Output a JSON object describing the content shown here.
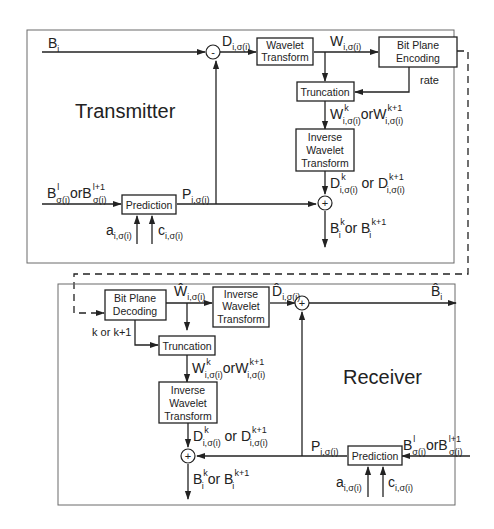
{
  "transmitter": {
    "title": "Transmitter",
    "blocks": {
      "wavelet_transform": [
        "Wavelet",
        "Transform"
      ],
      "bit_plane_encoding": [
        "Bit Plane",
        "Encoding"
      ],
      "truncation": [
        "Truncation"
      ],
      "inverse_wavelet_transform": [
        "Inverse",
        "Wavelet",
        "Transform"
      ],
      "prediction": [
        "Prediction"
      ]
    },
    "subtractor_sign": "-",
    "adder_sign": "+",
    "signals": {
      "input": {
        "base": "B",
        "sub": "i"
      },
      "difference": {
        "base": "D",
        "sub": "i,σ(i)"
      },
      "coefficients": {
        "base": "W",
        "sub": "i,σ(i)"
      },
      "rate": "rate",
      "truncated": {
        "base1": "W",
        "sup1": "k",
        "sub1": "i,σ(i)",
        "or": "or",
        "base2": "W",
        "sup2": "k+1",
        "sub2": "i,σ(i)"
      },
      "reconstructed_diff": {
        "base1": "D",
        "sup1": "k",
        "sub1": "i,σ(i)",
        "or": " or ",
        "base2": "D",
        "sup2": "k+1",
        "sub2": "i,σ(i)"
      },
      "reference": {
        "base1": "B",
        "sup1": "l",
        "sub1": "σ(i)",
        "or": "or",
        "base2": "B",
        "sup2": "l+1",
        "sub2": "σ(i)"
      },
      "prediction_out": {
        "base": "P",
        "sub": "i,σ(i)"
      },
      "param_a": {
        "base": "a",
        "sub": "i,σ(i)"
      },
      "param_c": {
        "base": "c",
        "sub": "i,σ(i)"
      },
      "output": {
        "base1": "B",
        "sup1": "k",
        "sub1": "i",
        "or": " or ",
        "base2": "B",
        "sup2": "k+1",
        "sub2": "i"
      }
    }
  },
  "receiver": {
    "title": "Receiver",
    "blocks": {
      "bit_plane_decoding": [
        "Bit Plane",
        "Decoding"
      ],
      "inverse_wavelet_transform_top": [
        "Inverse",
        "Wavelet",
        "Transform"
      ],
      "truncation": [
        "Truncation"
      ],
      "inverse_wavelet_transform": [
        "Inverse",
        "Wavelet",
        "Transform"
      ],
      "prediction": [
        "Prediction"
      ]
    },
    "adder_sign": "+",
    "signals": {
      "decoded_coeffs": {
        "base": "Ŵ",
        "sub": "i,σ(i)"
      },
      "decoded_diff": {
        "base": "D̂",
        "sub": "i,σ(i)"
      },
      "output_hat": {
        "base": "B̂",
        "sub": "i"
      },
      "layer_select": "k or k+1",
      "truncated": {
        "base1": "W",
        "sup1": "k",
        "sub1": "i,σ(i)",
        "or": "or",
        "base2": "W",
        "sup2": "k+1",
        "sub2": "i,σ(i)"
      },
      "reconstructed_diff": {
        "base1": "D",
        "sup1": "k",
        "sub1": "i,σ(i)",
        "or": " or ",
        "base2": "D",
        "sup2": "k+1",
        "sub2": "i,σ(i)"
      },
      "reference": {
        "base1": "B",
        "sup1": "l",
        "sub1": "σ(i)",
        "or": "or",
        "base2": "B",
        "sup2": "l+1",
        "sub2": "σ(i)"
      },
      "prediction_out": {
        "base": "P",
        "sub": "i,σ(i)"
      },
      "param_a": {
        "base": "a",
        "sub": "i,σ(i)"
      },
      "param_c": {
        "base": "c",
        "sub": "i,σ(i)"
      },
      "output": {
        "base1": "B",
        "sup1": "k",
        "sub1": "i",
        "or": " or ",
        "base2": "B",
        "sup2": "k+1",
        "sub2": "i"
      }
    }
  }
}
